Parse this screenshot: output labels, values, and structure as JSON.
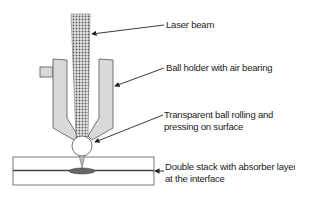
{
  "diagram": {
    "labels": {
      "laser_beam": "Laser beam",
      "ball_holder": "Ball holder with air bearing",
      "ball_line1": "Transparent ball rolling and",
      "ball_line2": "pressing on surface",
      "stack_line1": "Double stack with absorber layer",
      "stack_line2": "at the interface"
    },
    "colors": {
      "outline": "#555555",
      "holder_fill": "#d9d9d9",
      "beam_fill": "#cfcfcf",
      "arrow": "#222222",
      "melt_fill": "#666666"
    }
  }
}
